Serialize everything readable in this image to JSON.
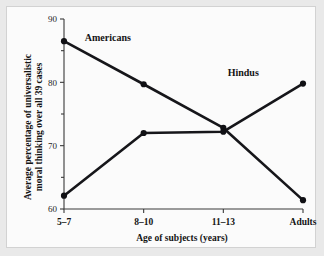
{
  "chart_data": {
    "type": "line",
    "title": "",
    "subtitle": "",
    "xlabel": "Age of subjects (years)",
    "ylabel": "Average percentage of universalistic moral thinking over all 39 cases",
    "ylabel_line1": "Average percentage of universalistic",
    "ylabel_line2": "moral thinking over all 39 cases",
    "categories": [
      "5–7",
      "8–10",
      "11–13",
      "Adults"
    ],
    "ylim": [
      60,
      90
    ],
    "xlim": [
      0,
      3
    ],
    "y_ticks_major": [
      60,
      70,
      80,
      90
    ],
    "y_tick_labels": [
      "60",
      "70",
      "80",
      "90"
    ],
    "y_ticks_minor": [
      65,
      75,
      85
    ],
    "grid": false,
    "legend_position": "inline-annotation",
    "series": [
      {
        "name": "Americans",
        "values": [
          86.5,
          79.7,
          72.8,
          61.4
        ],
        "color": "#101014",
        "label_x_index": 0.55,
        "label_y": 87.0
      },
      {
        "name": "Hindus",
        "values": [
          62.1,
          72.0,
          72.2,
          79.8
        ],
        "color": "#101014",
        "label_x_index": 2.25,
        "label_y": 81.5
      }
    ],
    "annotations": [
      {
        "text": "Americans"
      },
      {
        "text": "Hindus"
      }
    ]
  },
  "figure": {
    "background": "#fbfbfb",
    "border_color": "#d2d2d2",
    "axis_color": "#3a3a3a",
    "line_color": "#101014"
  }
}
